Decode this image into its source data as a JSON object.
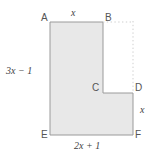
{
  "figure": {
    "fill_color": "#e8e8e8",
    "stroke_color": "#9a9a9a",
    "dotted_color": "#c9c9c9",
    "label_color": "#4a4a4a"
  },
  "vertices": [
    {
      "id": "A",
      "label": "A",
      "x": 41,
      "y": 17
    },
    {
      "id": "B",
      "label": "B",
      "x": 104,
      "y": 17
    },
    {
      "id": "C",
      "label": "C",
      "x": 92,
      "y": 88
    },
    {
      "id": "D",
      "label": "D",
      "x": 134,
      "y": 88
    },
    {
      "id": "E",
      "label": "E",
      "x": 41,
      "y": 130
    },
    {
      "id": "F",
      "label": "F",
      "x": 134,
      "y": 130
    }
  ],
  "dimensions": [
    {
      "id": "top",
      "text": "x",
      "plain": "x",
      "side": "AB",
      "x": 71,
      "y": 7
    },
    {
      "id": "left",
      "text": "3x − 1",
      "plain": "3x - 1",
      "side": "AE",
      "x": 5,
      "y": 68
    },
    {
      "id": "bottom",
      "text": "2x + 1",
      "plain": "2x + 1",
      "side": "EF",
      "x": 76,
      "y": 142
    },
    {
      "id": "right",
      "text": "x",
      "plain": "x",
      "side": "DF",
      "x": 139,
      "y": 107
    }
  ],
  "dimension_parts": {
    "left": {
      "coef": "3x",
      "operator": "−",
      "constant": "1"
    },
    "bottom": {
      "coef": "2x",
      "operator": "+",
      "constant": "1"
    }
  },
  "shape": {
    "type": "polygon",
    "points": "50,22 103,22 103,93 133,93 133,135 50,135",
    "description": "L-shaped hexagon A-B-C-D-F-E"
  },
  "construction_lines": [
    {
      "id": "b-to-corner",
      "from": "B",
      "to": "upper-right-corner",
      "style": "dotted",
      "x1": 103,
      "y1": 22,
      "x2": 133,
      "y2": 22
    },
    {
      "id": "corner-to-d",
      "from": "upper-right-corner",
      "to": "D",
      "style": "dotted",
      "x1": 133,
      "y1": 22,
      "x2": 133,
      "y2": 93
    }
  ]
}
